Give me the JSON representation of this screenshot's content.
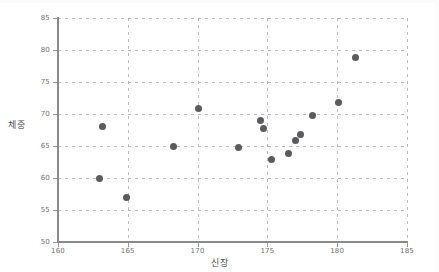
{
  "chart_data": {
    "type": "scatter",
    "title": "",
    "xlabel": "신장",
    "ylabel": "체중",
    "xlim": [
      160,
      185
    ],
    "ylim": [
      50,
      85
    ],
    "xticks": [
      160,
      165,
      170,
      175,
      180,
      185
    ],
    "yticks": [
      50,
      55,
      60,
      65,
      70,
      75,
      80,
      85
    ],
    "grid": true,
    "legend": false,
    "marker_color": "#5b5b5f",
    "grid_color": "#b9b9b9",
    "axis_color": "#8a8a8a",
    "points": [
      {
        "x": 163.2,
        "y": 68.0
      },
      {
        "x": 163.0,
        "y": 60.0
      },
      {
        "x": 164.9,
        "y": 57.0
      },
      {
        "x": 168.3,
        "y": 64.9
      },
      {
        "x": 170.1,
        "y": 70.9
      },
      {
        "x": 172.9,
        "y": 64.8
      },
      {
        "x": 174.5,
        "y": 69.0
      },
      {
        "x": 174.7,
        "y": 67.8
      },
      {
        "x": 175.3,
        "y": 62.9
      },
      {
        "x": 176.5,
        "y": 63.8
      },
      {
        "x": 177.0,
        "y": 65.8
      },
      {
        "x": 177.4,
        "y": 66.8
      },
      {
        "x": 178.2,
        "y": 69.8
      },
      {
        "x": 180.1,
        "y": 71.8
      },
      {
        "x": 181.3,
        "y": 78.9
      }
    ]
  }
}
